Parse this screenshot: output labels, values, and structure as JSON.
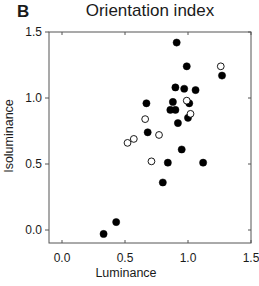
{
  "panel_label": "B",
  "chart_data": {
    "type": "scatter",
    "title": "Orientation index",
    "xlabel": "Luminance",
    "ylabel": "Isoluminance",
    "xlim": [
      -0.1,
      1.5
    ],
    "ylim": [
      -0.1,
      1.5
    ],
    "xticks": [
      "0.0",
      "0.5",
      "1.0",
      "1.5"
    ],
    "yticks": [
      "0.0",
      "0.5",
      "1.0",
      "1.5"
    ],
    "grid": false,
    "legend": null,
    "series": [
      {
        "name": "filled",
        "marker": "filled-circle",
        "color": "#000000",
        "points": [
          [
            0.91,
            1.42
          ],
          [
            0.99,
            1.24
          ],
          [
            1.27,
            1.17
          ],
          [
            0.9,
            1.08
          ],
          [
            0.97,
            1.07
          ],
          [
            1.06,
            1.06
          ],
          [
            0.67,
            0.96
          ],
          [
            0.88,
            0.97
          ],
          [
            1.01,
            0.96
          ],
          [
            0.86,
            0.91
          ],
          [
            0.9,
            0.91
          ],
          [
            1.0,
            0.85
          ],
          [
            0.92,
            0.81
          ],
          [
            0.68,
            0.74
          ],
          [
            0.95,
            0.61
          ],
          [
            0.84,
            0.51
          ],
          [
            1.12,
            0.51
          ],
          [
            0.8,
            0.36
          ],
          [
            0.43,
            0.06
          ],
          [
            0.33,
            -0.03
          ]
        ]
      },
      {
        "name": "open",
        "marker": "open-circle",
        "color": "#000000",
        "points": [
          [
            1.26,
            1.24
          ],
          [
            0.99,
            0.98
          ],
          [
            1.02,
            0.88
          ],
          [
            0.66,
            0.84
          ],
          [
            0.77,
            0.72
          ],
          [
            0.57,
            0.69
          ],
          [
            0.52,
            0.66
          ],
          [
            0.71,
            0.52
          ]
        ]
      }
    ]
  }
}
